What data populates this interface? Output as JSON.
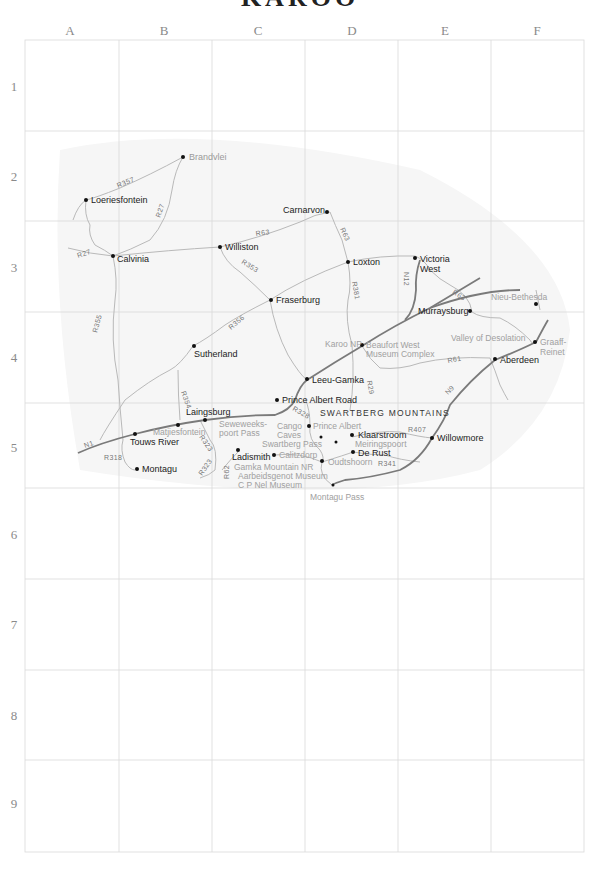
{
  "map": {
    "title": "KAROO",
    "columns": [
      "A",
      "B",
      "C",
      "D",
      "E",
      "F"
    ],
    "rows": [
      "1",
      "2",
      "3",
      "4",
      "5",
      "6",
      "7",
      "8",
      "9"
    ],
    "colors": {
      "grid": "#d9d9d9",
      "minor_road": "#b9b9b9",
      "major_road": "#7a7a7a",
      "town": "#222222",
      "poi": "#a0a0a0"
    },
    "towns": [
      {
        "id": "brandvlei",
        "label": "Brandvlei",
        "style": "grey"
      },
      {
        "id": "loeriesfontein",
        "label": "Loeriesfontein"
      },
      {
        "id": "calvinia",
        "label": "Calvinia"
      },
      {
        "id": "williston",
        "label": "Williston"
      },
      {
        "id": "carnarvon",
        "label": "Carnarvon"
      },
      {
        "id": "loxton",
        "label": "Loxton"
      },
      {
        "id": "victoria_west_1",
        "label": "Victoria"
      },
      {
        "id": "victoria_west_2",
        "label": "West"
      },
      {
        "id": "fraserburg",
        "label": "Fraserburg"
      },
      {
        "id": "murraysburg",
        "label": "Murraysburg"
      },
      {
        "id": "sutherland",
        "label": "Sutherland"
      },
      {
        "id": "aberdeen",
        "label": "Aberdeen"
      },
      {
        "id": "leeu_gamka",
        "label": "Leeu-Gamka"
      },
      {
        "id": "prince_albert_road",
        "label": "Prince Albert Road"
      },
      {
        "id": "laingsburg",
        "label": "Laingsburg"
      },
      {
        "id": "touws_river",
        "label": "Touws River"
      },
      {
        "id": "montagu",
        "label": "Montagu"
      },
      {
        "id": "ladismith",
        "label": "Ladismith"
      },
      {
        "id": "klaarstroom",
        "label": "Klaarstroom"
      },
      {
        "id": "de_rust",
        "label": "De Rust"
      },
      {
        "id": "willowmore",
        "label": "Willowmore"
      }
    ],
    "pois": [
      {
        "id": "nieu_bethesda",
        "label": "Nieu-Bethesda"
      },
      {
        "id": "valley_of_desolation",
        "label": "Valley of Desolation"
      },
      {
        "id": "graaff_reinet_1",
        "label": "Graaff-"
      },
      {
        "id": "graaff_reinet_2",
        "label": "Reinet"
      },
      {
        "id": "karoo_np",
        "label": "Karoo NP"
      },
      {
        "id": "beaufort_west_1",
        "label": "Beaufort West"
      },
      {
        "id": "beaufort_west_2",
        "label": "Museum Complex"
      },
      {
        "id": "matjiesfontein",
        "label": "Matjiesfontein"
      },
      {
        "id": "seweweekspoort_1",
        "label": "Seweweeks-"
      },
      {
        "id": "seweweekspoort_2",
        "label": "poort Pass"
      },
      {
        "id": "cango_1",
        "label": "Cango"
      },
      {
        "id": "cango_2",
        "label": "Caves"
      },
      {
        "id": "prince_albert",
        "label": "Prince Albert"
      },
      {
        "id": "swartberg_pass",
        "label": "Swartberg Pass"
      },
      {
        "id": "calitzdorp",
        "label": "Calitzdorp"
      },
      {
        "id": "meiringspoort",
        "label": "Meiringspoort"
      },
      {
        "id": "oudtshoorn",
        "label": "Oudtshoorn"
      },
      {
        "id": "gamka_np",
        "label": "Gamka Mountain NR"
      },
      {
        "id": "aarbeidsgenot",
        "label": "Aarbeidsgenot Museum"
      },
      {
        "id": "cp_nel",
        "label": "C P Nel Museum"
      },
      {
        "id": "montagu_pass",
        "label": "Montagu Pass"
      }
    ],
    "regions": [
      {
        "id": "swartberg",
        "label": "SWARTBERG MOUNTAINS"
      }
    ],
    "roads": [
      "R357",
      "R27",
      "R27",
      "R63",
      "R63",
      "R353",
      "R381",
      "N12",
      "R63",
      "R355",
      "R356",
      "R61",
      "N9",
      "R29",
      "R354",
      "R328",
      "N1",
      "R318",
      "R323",
      "R323",
      "R62",
      "R407",
      "R341"
    ]
  }
}
